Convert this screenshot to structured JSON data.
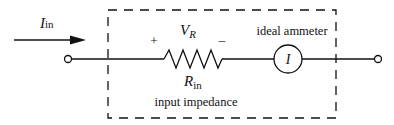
{
  "diagram": {
    "type": "circuit",
    "input_current": {
      "symbol": "I",
      "subscript": "in"
    },
    "resistor": {
      "voltage_label": {
        "symbol": "V",
        "subscript": "R"
      },
      "plus_sign": "+",
      "minus_sign": "–",
      "resistance_label": {
        "symbol": "R",
        "subscript": "in"
      }
    },
    "ammeter": {
      "label": "ideal ammeter",
      "symbol": "I"
    },
    "box_caption": "input impedance",
    "colors": {
      "line": "#111111",
      "background": "#ffffff"
    }
  }
}
